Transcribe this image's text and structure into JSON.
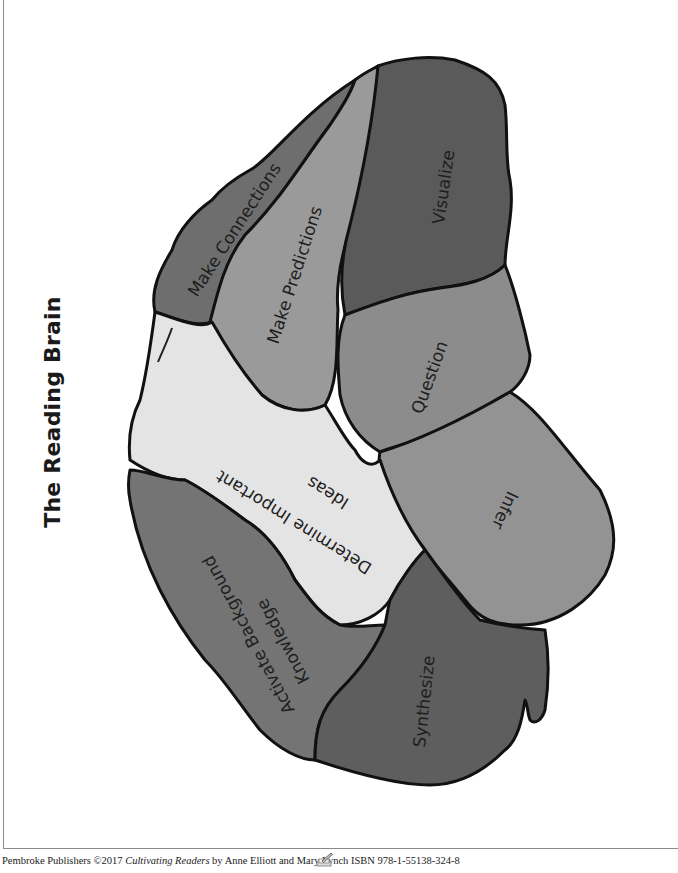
{
  "page": {
    "title": "The Reading Brain"
  },
  "brain_regions": [
    {
      "id": "make-connections",
      "label": "Make Connections",
      "color": "#6e6e6e"
    },
    {
      "id": "make-predictions",
      "label": "Make Predictions",
      "color": "#9a9a9a"
    },
    {
      "id": "visualize",
      "label": "Visualize",
      "color": "#5a5a5a"
    },
    {
      "id": "question",
      "label": "Question",
      "color": "#8c8c8c"
    },
    {
      "id": "infer",
      "label": "Infer",
      "color": "#939393"
    },
    {
      "id": "determine-important-ideas",
      "label_line1": "Determine Important",
      "label_line2": "Ideas",
      "color": "#e4e4e4"
    },
    {
      "id": "activate-background-knowledge",
      "label_line1": "Activate Background",
      "label_line2": "Knowledge",
      "color": "#747474"
    },
    {
      "id": "synthesize",
      "label": "Synthesize",
      "color": "#5e5e5e"
    }
  ],
  "footer": {
    "publisher": "Pembroke Publishers ©2017 ",
    "book_title": "Cultivating Readers",
    "authors_isbn": " by Anne Elliott and Mary Lynch ISBN 978-1-55138-324-8"
  }
}
